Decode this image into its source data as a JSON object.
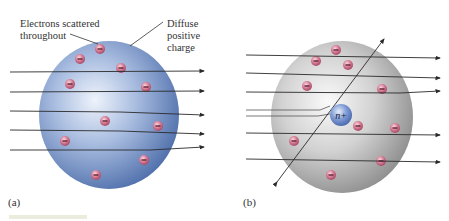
{
  "panel_a": {
    "label": "(a)",
    "annotation_electrons_line1": "Electrons scattered",
    "annotation_electrons_line2": "throughout",
    "annotation_charge_line1": "Diffuse",
    "annotation_charge_line2": "positive",
    "annotation_charge_line3": "charge",
    "sphere_color": "#7f9ccc",
    "electron_symbol": "−",
    "electron_count": 11
  },
  "panel_b": {
    "label": "(b)",
    "nucleus_label": "n+",
    "sphere_color": "#c8c8c8",
    "nucleus_color": "#6f8fcf",
    "electron_symbol": "−",
    "electron_count": 11
  },
  "colors": {
    "electron_fill": "#c0607a",
    "arrow": "#2a2a2a"
  }
}
